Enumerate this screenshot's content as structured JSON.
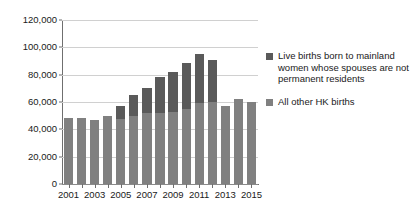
{
  "chart_data": {
    "type": "bar",
    "subtype": "stacked-column",
    "title": "",
    "xlabel": "",
    "ylabel": "",
    "ylim": [
      0,
      120000
    ],
    "ytick_labels": [
      "0",
      "20,000",
      "40,000",
      "60,000",
      "80,000",
      "100,000",
      "120,000"
    ],
    "ytick_values": [
      0,
      20000,
      40000,
      60000,
      80000,
      100000,
      120000
    ],
    "grid": true,
    "legend_position": "right",
    "categories": [
      "2001",
      "2002",
      "2003",
      "2004",
      "2005",
      "2006",
      "2007",
      "2008",
      "2009",
      "2010",
      "2011",
      "2012",
      "2013",
      "2014",
      "2015"
    ],
    "xtick_labels": [
      "2001",
      "2003",
      "2005",
      "2007",
      "2009",
      "2011",
      "2013",
      "2015"
    ],
    "series": [
      {
        "name": "All other HK births",
        "color": "#808080",
        "values": [
          48200,
          48200,
          46900,
          49800,
          47600,
          49700,
          51800,
          51600,
          52800,
          54800,
          59600,
          59900,
          57100,
          62000,
          60100
        ]
      },
      {
        "name": "Live births born to mainland women whose spouses are not permanent residents",
        "color": "#5a5a5a",
        "values": [
          0,
          0,
          0,
          0,
          9400,
          15800,
          18600,
          26900,
          29000,
          33500,
          35500,
          31200,
          0,
          0,
          0
        ]
      }
    ],
    "totals": [
      48200,
      48200,
      46900,
      49800,
      57000,
      65500,
      70400,
      78500,
      81800,
      88300,
      95100,
      91100,
      57100,
      62000,
      60100
    ]
  },
  "legend": {
    "entries": [
      {
        "label": "Live births born to mainland women whose spouses are not permanent residents",
        "color": "#5a5a5a"
      },
      {
        "label": "All other HK births",
        "color": "#808080"
      }
    ]
  },
  "colors": {
    "series_dark": "#5a5a5a",
    "series_light": "#808080",
    "gridline": "#d0d0d0",
    "axis": "#6f6f6f",
    "text": "#1a1a1a",
    "background": "#ffffff"
  }
}
